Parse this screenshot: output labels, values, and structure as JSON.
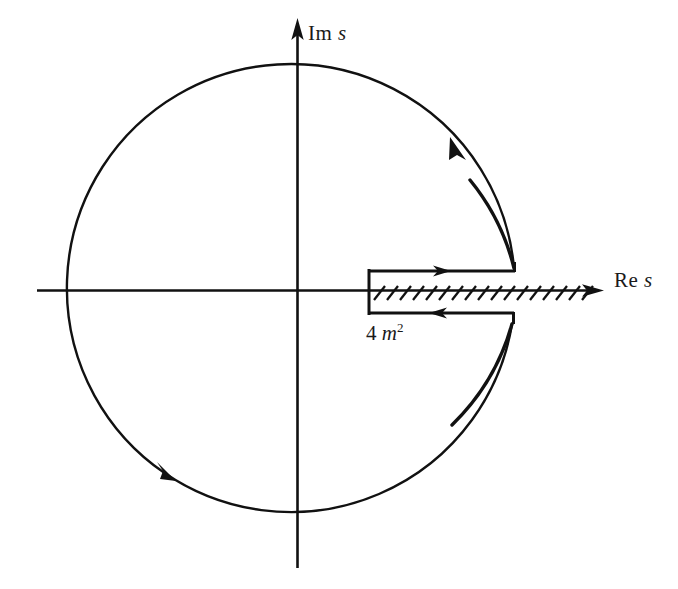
{
  "figure": {
    "kind": "complex-plane-contour-diagram",
    "background_color": "#ffffff",
    "ink_color": "#111111",
    "width": 678,
    "height": 589
  },
  "axes": {
    "imaginary": {
      "label_prefix": "Im",
      "label_variable": "s",
      "label_text": "Im s",
      "arrow": "up",
      "x": 297,
      "top_y": 18,
      "bottom_y": 568
    },
    "real": {
      "label_prefix": "Re",
      "label_variable": "s",
      "label_text": "Re s",
      "arrow": "right",
      "y": 290,
      "left_x": 37,
      "right_x": 604
    },
    "origin": {
      "x": 297,
      "y": 291
    }
  },
  "circle": {
    "name": "large-circular-contour",
    "center_x": 297,
    "center_y": 296,
    "radius": 224,
    "direction": "counterclockwise",
    "arrows": [
      {
        "name": "arc-arrow-upper-right",
        "x": 456,
        "y": 146,
        "direction": "counterclockwise"
      },
      {
        "name": "arc-arrow-lower-left",
        "x": 163,
        "y": 468,
        "direction": "counterclockwise"
      }
    ]
  },
  "branch_cut": {
    "name": "branch-cut-hatched-line",
    "start_x": 368,
    "end_x": 596,
    "y": 291,
    "hatch_count": 18,
    "hatch_spacing": 13,
    "hatch_length": 15,
    "hatch_angle_deg": -58
  },
  "keyhole_contour": {
    "name": "keyhole-contour-around-cut",
    "left_x": 368,
    "right_x": 515,
    "top_y": 271,
    "bottom_y": 313,
    "arrows": [
      {
        "name": "cut-top-arrow",
        "x": 443,
        "y": 271,
        "direction": "right"
      },
      {
        "name": "cut-bottom-arrow",
        "x": 437,
        "y": 313,
        "direction": "left"
      }
    ]
  },
  "labels": {
    "imaginary_axis": {
      "prefix": "Im",
      "variable": "s"
    },
    "real_axis": {
      "prefix": "Re",
      "variable": "s"
    },
    "threshold": {
      "coefficient": "4",
      "variable": "m",
      "exponent": "2",
      "full_text": "4 m2"
    }
  }
}
